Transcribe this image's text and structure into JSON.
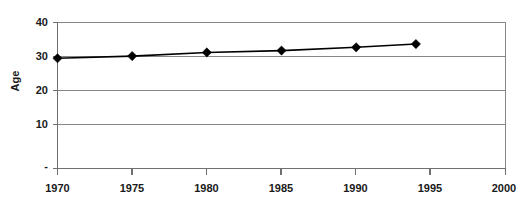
{
  "chart_data": {
    "type": "line",
    "title": "",
    "subtitle": "",
    "xlabel": "",
    "ylabel": "Age",
    "x": [
      1970,
      1975,
      1980,
      1985,
      1990,
      1994
    ],
    "values": [
      30.2,
      30.8,
      31.8,
      32.3,
      33.2,
      34.1
    ],
    "series": [
      {
        "name": "Age",
        "values": [
          30.2,
          30.8,
          31.8,
          32.3,
          33.2,
          34.1
        ]
      }
    ],
    "xlim": [
      1970,
      2000
    ],
    "ylim": [
      0,
      40
    ],
    "x_tick_labels": [
      "1970",
      "1975",
      "1980",
      "1985",
      "1990",
      "1995",
      "2000"
    ],
    "x_tick_values": [
      1970,
      1975,
      1980,
      1985,
      1990,
      1995,
      2000
    ],
    "y_tick_labels": [
      "-",
      "10",
      "20",
      "30",
      "40"
    ],
    "y_tick_values": [
      0,
      10,
      20,
      30,
      40
    ],
    "grid": "horizontal",
    "legend": "none",
    "marker": "diamond",
    "line_color": "#000000",
    "marker_color": "#000000",
    "gridline_color": "#868686",
    "axis_color": "#6f6f6f",
    "background_color": "#ffffff",
    "annotations": []
  },
  "axis": {
    "y_title": "Age",
    "y_ticks": [
      {
        "label": "40",
        "value": 40
      },
      {
        "label": "30",
        "value": 30
      },
      {
        "label": "20",
        "value": 20
      },
      {
        "label": "10",
        "value": 10
      },
      {
        "label": "-",
        "value": 0
      }
    ],
    "x_ticks": [
      {
        "label": "1970",
        "value": 1970
      },
      {
        "label": "1975",
        "value": 1975
      },
      {
        "label": "1980",
        "value": 1980
      },
      {
        "label": "1985",
        "value": 1985
      },
      {
        "label": "1990",
        "value": 1990
      },
      {
        "label": "1995",
        "value": 1995
      },
      {
        "label": "2000",
        "value": 2000
      }
    ]
  }
}
